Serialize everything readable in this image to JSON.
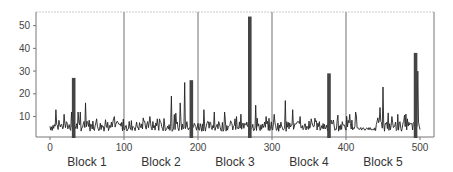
{
  "chart_data": {
    "type": "line",
    "title": "",
    "xlabel": "",
    "ylabel": "",
    "xlim": [
      -18,
      519
    ],
    "ylim": [
      1,
      56
    ],
    "x_ticks": [
      0,
      100,
      200,
      300,
      400,
      500
    ],
    "y_ticks": [
      10,
      20,
      30,
      40,
      50
    ],
    "grid": false,
    "block_dividers": [
      100,
      200,
      300,
      400
    ],
    "blocks": [
      {
        "label": "Block 1",
        "center": 50
      },
      {
        "label": "Block 2",
        "center": 150
      },
      {
        "label": "Block 3",
        "center": 250
      },
      {
        "label": "Block 4",
        "center": 350
      },
      {
        "label": "Block 5",
        "center": 450
      }
    ],
    "highlight_bars": [
      {
        "x": 32,
        "value": 27
      },
      {
        "x": 191,
        "value": 26
      },
      {
        "x": 270,
        "value": 54
      },
      {
        "x": 377,
        "value": 29
      },
      {
        "x": 494,
        "value": 38
      }
    ],
    "series": [
      {
        "name": "signal",
        "peaks": [
          {
            "x": 8,
            "value": 13
          },
          {
            "x": 19,
            "value": 11
          },
          {
            "x": 29,
            "value": 12
          },
          {
            "x": 41,
            "value": 12
          },
          {
            "x": 48,
            "value": 16
          },
          {
            "x": 58,
            "value": 8
          },
          {
            "x": 63,
            "value": 9
          },
          {
            "x": 128,
            "value": 8
          },
          {
            "x": 135,
            "value": 10
          },
          {
            "x": 145,
            "value": 9
          },
          {
            "x": 164,
            "value": 19
          },
          {
            "x": 176,
            "value": 16
          },
          {
            "x": 182,
            "value": 25
          },
          {
            "x": 208,
            "value": 13
          },
          {
            "x": 222,
            "value": 12
          },
          {
            "x": 236,
            "value": 12
          },
          {
            "x": 252,
            "value": 10
          },
          {
            "x": 278,
            "value": 15
          },
          {
            "x": 292,
            "value": 10
          },
          {
            "x": 303,
            "value": 11
          },
          {
            "x": 318,
            "value": 17
          },
          {
            "x": 328,
            "value": 13
          },
          {
            "x": 338,
            "value": 10
          },
          {
            "x": 350,
            "value": 8
          },
          {
            "x": 388,
            "value": 8
          },
          {
            "x": 405,
            "value": 11
          },
          {
            "x": 413,
            "value": 12
          },
          {
            "x": 446,
            "value": 14
          },
          {
            "x": 450,
            "value": 23
          },
          {
            "x": 462,
            "value": 10
          },
          {
            "x": 470,
            "value": 11
          },
          {
            "x": 483,
            "value": 9
          },
          {
            "x": 497,
            "value": 30
          }
        ],
        "baseline": 4
      }
    ]
  }
}
